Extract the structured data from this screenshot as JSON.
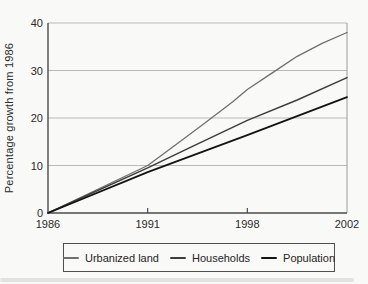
{
  "chart_data": {
    "type": "line",
    "title": "",
    "xlabel": "",
    "ylabel": "Percentage growth from 1986",
    "ylim": [
      0,
      40
    ],
    "y_ticks": [
      0,
      10,
      20,
      30,
      40
    ],
    "x_tick_labels": [
      "1986",
      "1991",
      "1998",
      "2002"
    ],
    "x_tick_years": [
      1986,
      1991,
      1998,
      2002
    ],
    "grid": "horizontal-gridlines",
    "legend_position": "bottom",
    "categories": [
      "1986",
      "1991",
      "1998",
      "2002"
    ],
    "series": [
      {
        "name": "Urbanized land",
        "values": [
          0,
          10,
          26,
          38
        ],
        "color": "#6f6f6f",
        "line_width": 1.3,
        "points": [
          [
            1986,
            0
          ],
          [
            1991,
            10
          ],
          [
            1993,
            14.4
          ],
          [
            1995,
            18.9
          ],
          [
            1997,
            23.5
          ],
          [
            1998,
            26
          ],
          [
            1999,
            29.5
          ],
          [
            2000,
            33
          ],
          [
            2001,
            35.7
          ],
          [
            2002,
            38
          ]
        ]
      },
      {
        "name": "Households",
        "values": [
          0,
          9.5,
          19.5,
          28.5
        ],
        "color": "#3d3d3d",
        "line_width": 1.5,
        "points": [
          [
            1986,
            0
          ],
          [
            1991,
            9.5
          ],
          [
            1994,
            13.8
          ],
          [
            1998,
            19.5
          ],
          [
            2000,
            23.8
          ],
          [
            2002,
            28.5
          ]
        ]
      },
      {
        "name": "Population",
        "values": [
          0,
          8.5,
          16.5,
          24.5
        ],
        "color": "#141414",
        "line_width": 1.8,
        "points": [
          [
            1986,
            0
          ],
          [
            1991,
            8.6
          ],
          [
            1998,
            16.4
          ],
          [
            2002,
            24.4
          ]
        ]
      }
    ]
  },
  "style": {
    "grid_color": "#b9b9b9",
    "axis_color": "#4b4b4b",
    "right_border_color": "#9c9c9c",
    "tick_label_color": "#2a2a2a",
    "background": "#f9f9f7"
  }
}
